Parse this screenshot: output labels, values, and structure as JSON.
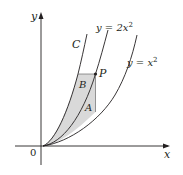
{
  "diagram": {
    "type": "graph-of-curves",
    "axes": {
      "x_label": "x",
      "y_label": "y",
      "origin_label": "0"
    },
    "curves": [
      {
        "id": "C",
        "label": "C",
        "equation": null
      },
      {
        "id": "two-x-squared",
        "label": "y = 2x",
        "superscript": "2",
        "equation": "y = 2x^2"
      },
      {
        "id": "x-squared",
        "label": "y = x",
        "superscript": "2",
        "equation": "y = x^2"
      }
    ],
    "point": {
      "label": "P",
      "on_curve": "y = 2x^2"
    },
    "regions": [
      {
        "label": "A",
        "description": "shaded region between y = 2x^2 and y = x^2, bounded on the right by vertical line through P"
      },
      {
        "label": "B",
        "description": "shaded region between curve C and y = 2x^2, bounded above by horizontal line through P"
      }
    ],
    "colors": {
      "line": "#231f20",
      "shade": "#d9d9d9",
      "background": "#ffffff"
    }
  }
}
